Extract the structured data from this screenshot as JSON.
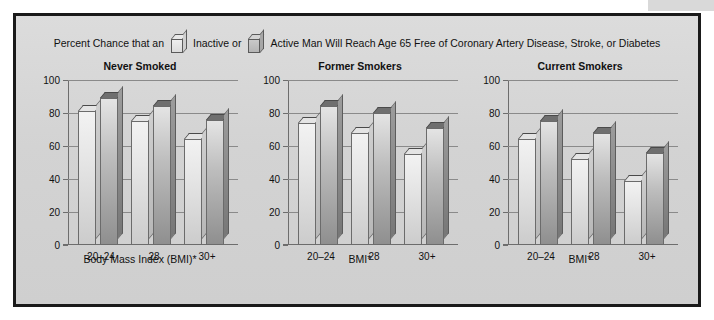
{
  "legend": {
    "prefix_text": "Percent Chance that an",
    "inactive_label": "Inactive or",
    "active_label": "Active Man Will Reach Age 65 Free of Coronary Artery Disease, Stroke, or Diabetes",
    "inactive_icon": "bar-swatch-light-icon",
    "active_icon": "bar-swatch-dark-icon"
  },
  "colors": {
    "frame_border": "#1a1a1a",
    "background": "#d4d4d4",
    "gridline": "#8a8a8a",
    "axis": "#6d6d6d",
    "inactive_bar": "#e6e6e6",
    "active_bar": "#a8a8a8",
    "text": "#111111"
  },
  "chart_data": {
    "type": "bar",
    "xlabel": "Body Mass Index (BMI)*",
    "ylabel": "",
    "ylim": [
      0,
      100
    ],
    "yticks": [
      0,
      20,
      40,
      60,
      80,
      100
    ],
    "ytick_labels": [
      "0",
      "20",
      "40",
      "60",
      "80",
      "100"
    ],
    "grid": true,
    "legend_position": "top",
    "categories": [
      "20–24",
      "28",
      "30+"
    ],
    "series_names": [
      "Inactive",
      "Active"
    ],
    "panels": [
      {
        "title": "Never Smoked",
        "xlabel": "Body Mass Index (BMI)*",
        "categories": [
          "20–24",
          "28",
          "30+"
        ],
        "series": [
          {
            "name": "Inactive",
            "values": [
              81,
              75,
              64
            ]
          },
          {
            "name": "Active",
            "values": [
              89,
              84,
              76
            ]
          }
        ]
      },
      {
        "title": "Former Smokers",
        "xlabel": "BMI*",
        "categories": [
          "20–24",
          "28",
          "30+"
        ],
        "series": [
          {
            "name": "Inactive",
            "values": [
              74,
              68,
              55
            ]
          },
          {
            "name": "Active",
            "values": [
              84,
              80,
              71
            ]
          }
        ]
      },
      {
        "title": "Current Smokers",
        "xlabel": "BMI*",
        "categories": [
          "20–24",
          "28",
          "30+"
        ],
        "series": [
          {
            "name": "Inactive",
            "values": [
              64,
              52,
              39
            ]
          },
          {
            "name": "Active",
            "values": [
              75,
              68,
              56
            ]
          }
        ]
      }
    ]
  }
}
